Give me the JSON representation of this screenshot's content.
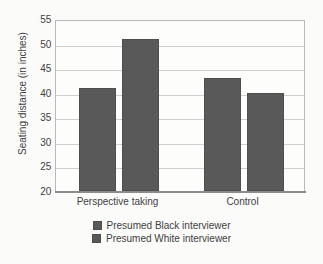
{
  "chart_data": {
    "type": "bar",
    "title": "",
    "xlabel": "",
    "ylabel": "Seating distance (in inches)",
    "categories": [
      "Perspective taking",
      "Control"
    ],
    "series": [
      {
        "name": "Presumed Black interviewer",
        "values": [
          41,
          43
        ],
        "color": "#595959"
      },
      {
        "name": "Presumed White interviewer",
        "values": [
          51,
          40
        ],
        "color": "#595959"
      }
    ],
    "ylim": [
      20,
      55
    ],
    "yticks": [
      20,
      25,
      30,
      35,
      40,
      45,
      50,
      55
    ],
    "ytick_labels": [
      "20",
      "25",
      "30",
      "35",
      "40",
      "45",
      "50",
      "55"
    ],
    "grid": "horizontal",
    "legend_position": "bottom"
  },
  "legend": {
    "items": [
      {
        "label": "Presumed Black interviewer"
      },
      {
        "label": "Presumed White interviewer"
      }
    ]
  },
  "axis": {
    "y_title": "Seating distance (in inches)"
  }
}
